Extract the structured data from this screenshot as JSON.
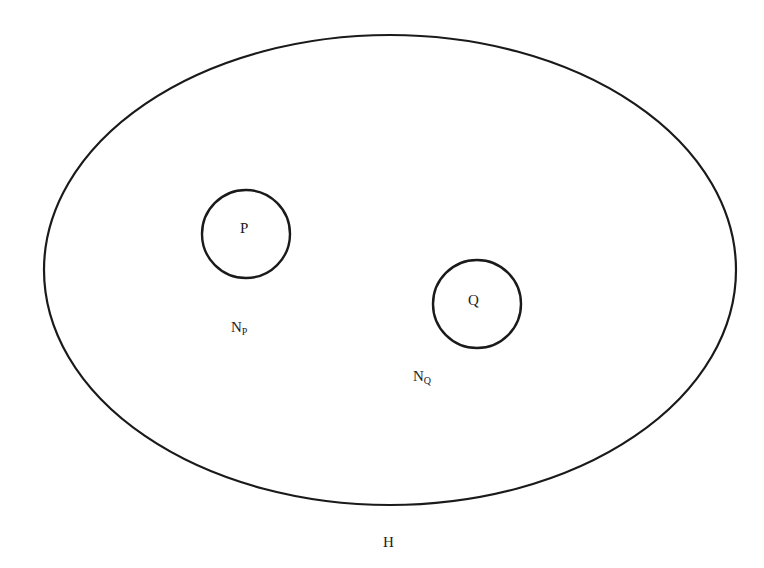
{
  "diagram": {
    "type": "set-diagram",
    "outer_set": {
      "label": "H",
      "shape": "ellipse",
      "cx": 390,
      "cy": 270,
      "rx": 346,
      "ry": 235,
      "label_pos": {
        "x": 383,
        "y": 547
      }
    },
    "inner_sets": [
      {
        "label": "P",
        "shape": "circle",
        "cx": 246,
        "cy": 234,
        "r": 44,
        "label_pos": {
          "x": 240,
          "y": 233
        },
        "neighborhood": {
          "base": "N",
          "subscript": "P",
          "x": 231,
          "y": 332
        }
      },
      {
        "label": "Q",
        "shape": "circle",
        "cx": 477,
        "cy": 304,
        "r": 44,
        "label_pos": {
          "x": 468,
          "y": 305
        },
        "neighborhood": {
          "base": "N",
          "subscript": "Q",
          "x": 413,
          "y": 381
        }
      }
    ],
    "stroke_color": "#1a1a1a",
    "text_color": "#222222"
  }
}
